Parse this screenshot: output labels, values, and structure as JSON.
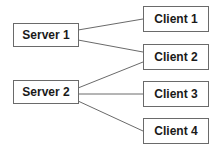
{
  "diagram": {
    "servers": [
      {
        "id": "server1",
        "label": "Server 1"
      },
      {
        "id": "server2",
        "label": "Server 2"
      }
    ],
    "clients": [
      {
        "id": "client1",
        "label": "Client 1"
      },
      {
        "id": "client2",
        "label": "Client 2"
      },
      {
        "id": "client3",
        "label": "Client 3"
      },
      {
        "id": "client4",
        "label": "Client 4"
      }
    ],
    "edges": [
      [
        "server1",
        "client1"
      ],
      [
        "server1",
        "client2"
      ],
      [
        "server2",
        "client2"
      ],
      [
        "server2",
        "client3"
      ],
      [
        "server2",
        "client4"
      ]
    ],
    "colors": {
      "border": "#6a6a6a",
      "line": "#6a6a6a",
      "text": "#1a1a1a"
    }
  }
}
